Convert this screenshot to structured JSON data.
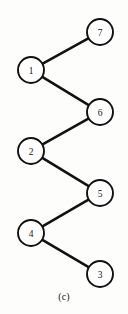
{
  "figure": {
    "caption": "(c)",
    "width": 128,
    "height": 314,
    "background_color": "#fdfdfc",
    "ink_color": "#141210"
  },
  "chart_data": {
    "type": "diagram",
    "diagram_type": "graph",
    "title": "(c)",
    "layout": "zigzag path",
    "node_radius": 13,
    "nodes": [
      {
        "id": "7",
        "label": "7",
        "x": 100,
        "y": 32
      },
      {
        "id": "1",
        "label": "1",
        "x": 31,
        "y": 70
      },
      {
        "id": "6",
        "label": "6",
        "x": 100,
        "y": 112
      },
      {
        "id": "2",
        "label": "2",
        "x": 31,
        "y": 151
      },
      {
        "id": "5",
        "label": "5",
        "x": 100,
        "y": 193
      },
      {
        "id": "4",
        "label": "4",
        "x": 31,
        "y": 233
      },
      {
        "id": "3",
        "label": "3",
        "x": 100,
        "y": 274
      }
    ],
    "edges": [
      {
        "from": "1",
        "to": "7"
      },
      {
        "from": "1",
        "to": "6"
      },
      {
        "from": "6",
        "to": "2"
      },
      {
        "from": "2",
        "to": "5"
      },
      {
        "from": "5",
        "to": "4"
      },
      {
        "from": "4",
        "to": "3"
      }
    ],
    "path_order": [
      "7",
      "1",
      "6",
      "2",
      "5",
      "4",
      "3"
    ]
  }
}
